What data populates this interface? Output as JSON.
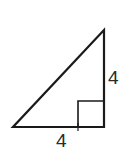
{
  "figure": {
    "kind": "right-triangle-diagram",
    "background_color": "#ffffff",
    "stroke_color": "#1a1a1a",
    "stroke_width": 2.2,
    "label_color": "#2b2b2b",
    "vertices": {
      "left_bottom": {
        "x": 13,
        "y": 127
      },
      "right_bottom": {
        "x": 104,
        "y": 127
      },
      "apex_top": {
        "x": 104,
        "y": 30
      }
    },
    "right_angle_marker": {
      "present": true,
      "corner": "right_bottom",
      "size": 26,
      "x": 78,
      "y": 101
    },
    "tick_marks": [
      {
        "name": "bottom-tick",
        "x": 78,
        "y": 127
      }
    ],
    "labels": {
      "vertical_side": "4",
      "horizontal_side": "4"
    }
  }
}
